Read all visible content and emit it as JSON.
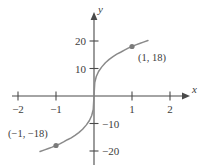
{
  "figure": {
    "kind": "cartesian-graph",
    "background_color": "#ffffff",
    "axis_color": "#4a4a4a",
    "curve_color": "#8a8a8a",
    "point_color": "#7a7a7a",
    "text_color": "#3c3c3c"
  },
  "axes": {
    "x_axis_label": "x",
    "y_axis_label": "y",
    "x_ticks": [
      {
        "value": -2,
        "label": "−2"
      },
      {
        "value": -1,
        "label": "−1"
      },
      {
        "value": 1,
        "label": "1"
      },
      {
        "value": 2,
        "label": "2"
      }
    ],
    "y_ticks": [
      {
        "value": 20,
        "label": "20"
      },
      {
        "value": 10,
        "label": "10"
      },
      {
        "value": -10,
        "label": "−10"
      },
      {
        "value": -20,
        "label": "−20"
      }
    ]
  },
  "annotations": [
    {
      "name": "point-label-positive",
      "text": "(1, 18)"
    },
    {
      "name": "point-label-negative",
      "text": "(−1, −18)"
    }
  ],
  "chart_data": {
    "type": "line",
    "title": "",
    "subtitle": "",
    "xlabel": "x",
    "ylabel": "y",
    "xlim": [
      -2.4,
      2.4
    ],
    "ylim": [
      -26,
      26
    ],
    "grid": false,
    "legend": null,
    "xticks": [
      -2,
      -1,
      1,
      2
    ],
    "xticklabels": [
      "−2",
      "−1",
      "1",
      "2"
    ],
    "yticks": [
      20,
      10,
      -10,
      -20
    ],
    "yticklabels": [
      "20",
      "10",
      "−10",
      "−20"
    ],
    "series": [
      {
        "name": "y = 18 · cbrt(x)",
        "x": [
          -1.42,
          -1.3,
          -1.2,
          -1.1,
          -1.0,
          -0.9,
          -0.8,
          -0.7,
          -0.6,
          -0.5,
          -0.4,
          -0.3,
          -0.2,
          -0.12,
          -0.06,
          -0.02,
          0,
          0.02,
          0.06,
          0.12,
          0.2,
          0.3,
          0.4,
          0.5,
          0.6,
          0.7,
          0.8,
          0.9,
          1.0,
          1.1,
          1.2,
          1.3,
          1.42
        ],
        "y": [
          -20.2,
          -19.6,
          -19.1,
          -18.6,
          -18.0,
          -17.4,
          -16.7,
          -15.9,
          -15.2,
          -14.3,
          -13.3,
          -12.1,
          -10.5,
          -8.9,
          -7.1,
          -4.9,
          0,
          4.9,
          7.1,
          8.9,
          10.5,
          12.1,
          13.3,
          14.3,
          15.2,
          15.9,
          16.7,
          17.4,
          18.0,
          18.6,
          19.1,
          19.6,
          20.2
        ]
      }
    ],
    "points": [
      {
        "x": 1,
        "y": 18,
        "label": "(1, 18)"
      },
      {
        "x": -1,
        "y": -18,
        "label": "(−1, −18)"
      }
    ]
  }
}
